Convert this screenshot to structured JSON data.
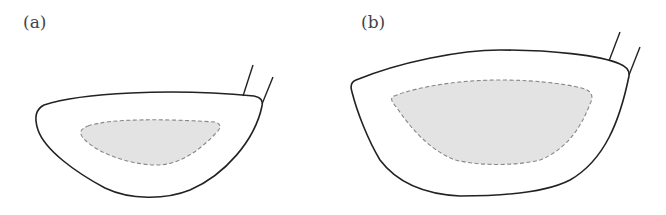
{
  "figure": {
    "panels": [
      {
        "label": "(a)",
        "description": "Smaller golf driver head with shaded sweet-spot region"
      },
      {
        "label": "(b)",
        "description": "Larger golf driver head with larger shaded sweet-spot region"
      }
    ],
    "colors": {
      "outline": "#222222",
      "shaded_fill": "#e3e3e3",
      "dashed_border": "#888888"
    }
  }
}
